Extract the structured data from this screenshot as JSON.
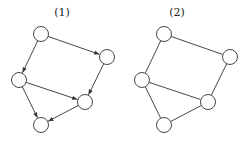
{
  "graphs": [
    {
      "label": "(1)",
      "directed": true,
      "label_pos": [
        62,
        16
      ],
      "nodes": [
        {
          "id": "a",
          "x": 41,
          "y": 34
        },
        {
          "id": "b",
          "x": 107,
          "y": 57
        },
        {
          "id": "c",
          "x": 19,
          "y": 80
        },
        {
          "id": "d",
          "x": 85,
          "y": 102
        },
        {
          "id": "e",
          "x": 41,
          "y": 125
        }
      ],
      "edges": [
        [
          "a",
          "b"
        ],
        [
          "a",
          "c"
        ],
        [
          "b",
          "d"
        ],
        [
          "c",
          "d"
        ],
        [
          "c",
          "e"
        ],
        [
          "d",
          "e"
        ]
      ]
    },
    {
      "label": "(2)",
      "directed": false,
      "label_pos": [
        177,
        16
      ],
      "nodes": [
        {
          "id": "a",
          "x": 164,
          "y": 34
        },
        {
          "id": "b",
          "x": 230,
          "y": 57
        },
        {
          "id": "c",
          "x": 142,
          "y": 80
        },
        {
          "id": "d",
          "x": 208,
          "y": 102
        },
        {
          "id": "e",
          "x": 164,
          "y": 125
        }
      ],
      "edges": [
        [
          "a",
          "b"
        ],
        [
          "a",
          "c"
        ],
        [
          "b",
          "d"
        ],
        [
          "c",
          "d"
        ],
        [
          "c",
          "e"
        ],
        [
          "d",
          "e"
        ]
      ]
    }
  ],
  "style": {
    "node_radius": 7.5,
    "stroke": "#333333",
    "fill": "#ffffff"
  }
}
